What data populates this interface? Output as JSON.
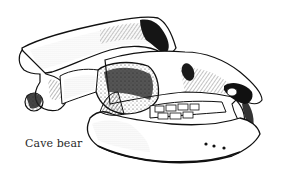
{
  "figure": {
    "style": "pen-and-ink stipple drawing",
    "caption": "Cave bear",
    "colors": {
      "background": "#ffffff",
      "ink": "#111111",
      "shade": "#3a3a3a",
      "caption": "#2a2a2a"
    }
  }
}
